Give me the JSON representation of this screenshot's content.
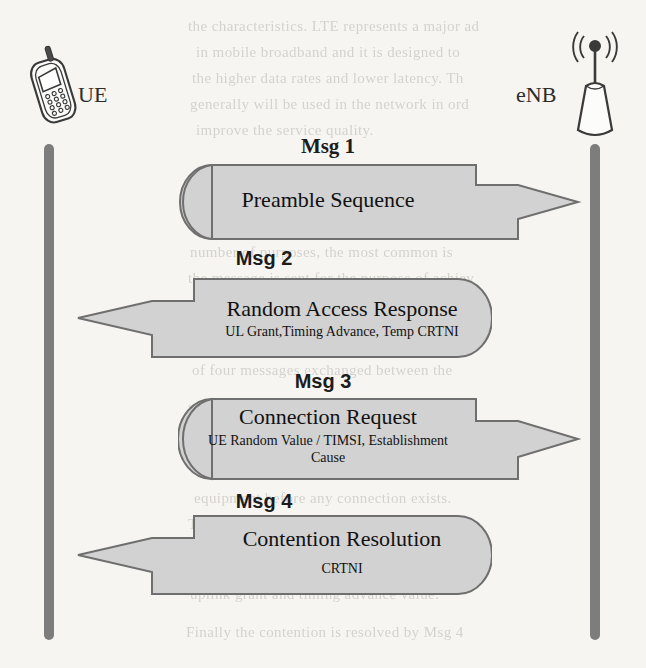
{
  "diagram": {
    "background_color": "#f6f5f2",
    "shape_fill": "#d2d2d2",
    "shape_stroke": "#6f6f6f",
    "lifeline_color": "#7d7d7d"
  },
  "nodes": {
    "left": {
      "label": "UE",
      "icon": "mobile-phone-icon"
    },
    "right": {
      "label": "eNB",
      "icon": "base-station-antenna-icon"
    }
  },
  "messages": [
    {
      "label": "Msg 1",
      "label_font": "serif",
      "title": "Preamble Sequence",
      "subtitle": "",
      "subtitle2": "",
      "direction": "right"
    },
    {
      "label": "Msg 2",
      "label_font": "sans",
      "title": "Random Access Response",
      "subtitle": "UL Grant,Timing Advance, Temp CRTNI",
      "subtitle2": "",
      "direction": "left"
    },
    {
      "label": "Msg 3",
      "label_font": "sans",
      "title": "Connection Request",
      "subtitle": "UE Random Value / TIMSI, Establishment",
      "subtitle2": "Cause",
      "direction": "right"
    },
    {
      "label": "Msg 4",
      "label_font": "sans",
      "title": "Contention Resolution",
      "subtitle": "CRTNI",
      "subtitle2": "",
      "direction": "left"
    }
  ],
  "background_bleed": [
    {
      "text": "the characteristics. LTE represents a major ad",
      "x": 188,
      "y": 18
    },
    {
      "text": "in mobile broadband and it is designed to",
      "x": 196,
      "y": 44
    },
    {
      "text": "the higher data rates and lower latency. Th",
      "x": 192,
      "y": 70
    },
    {
      "text": "generally will be used in the network in ord",
      "x": 190,
      "y": 96
    },
    {
      "text": "improve the service quality.",
      "x": 196,
      "y": 122
    },
    {
      "text": "Random Access Procedure",
      "x": 188,
      "y": 180,
      "bold": true
    },
    {
      "text": "The random access procedure is used for a",
      "x": 192,
      "y": 218
    },
    {
      "text": "number of purposes, the most common is",
      "x": 190,
      "y": 244
    },
    {
      "text": "the message is sent for the purpose of achiev",
      "x": 188,
      "y": 270
    },
    {
      "text": "the uplink synchronization between the UE",
      "x": 194,
      "y": 310
    },
    {
      "text": "and the base station. The procedure consists",
      "x": 190,
      "y": 336
    },
    {
      "text": "of four messages exchanged between the",
      "x": 192,
      "y": 362
    },
    {
      "text": "terminal and the network node. Msg 1 is",
      "x": 188,
      "y": 400
    },
    {
      "text": "sent on the PRACH carrying a preamble",
      "x": 192,
      "y": 426
    },
    {
      "text": "sequence chosen at random by the user",
      "x": 190,
      "y": 452
    },
    {
      "text": "equipment before any connection exists.",
      "x": 194,
      "y": 490
    },
    {
      "text": "The network replies with Msg 2 which is",
      "x": 188,
      "y": 516
    },
    {
      "text": "the random access response carrying the",
      "x": 192,
      "y": 542
    },
    {
      "text": "uplink grant and timing advance value.",
      "x": 190,
      "y": 586
    },
    {
      "text": "Finally the contention is resolved by Msg 4",
      "x": 186,
      "y": 624
    }
  ]
}
